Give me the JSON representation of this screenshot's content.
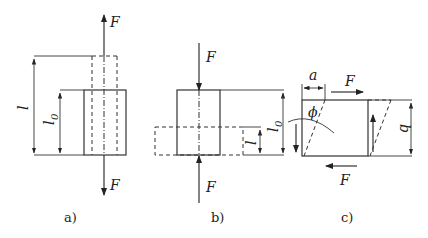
{
  "figure": {
    "panels": [
      {
        "id": "a",
        "caption": "a)",
        "description": "Tension: bar of original length l0 stretched to length l by forces F",
        "labels": {
          "force_top": "F",
          "force_bottom": "F",
          "length": "l",
          "original_length": "l",
          "original_length_sub": "0"
        }
      },
      {
        "id": "b",
        "caption": "b)",
        "description": "Compression: bar of original length l0 compressed to length l by forces F",
        "labels": {
          "force_top": "F",
          "force_bottom": "F",
          "length": "l",
          "original_length": "l",
          "original_length_sub": "0"
        }
      },
      {
        "id": "c",
        "caption": "c)",
        "description": "Shear: block of height b displaced by a at angle phi under forces F",
        "labels": {
          "displacement": "a",
          "force_top": "F",
          "force_bottom": "F",
          "angle": "ϕ",
          "height": "b"
        }
      }
    ]
  }
}
